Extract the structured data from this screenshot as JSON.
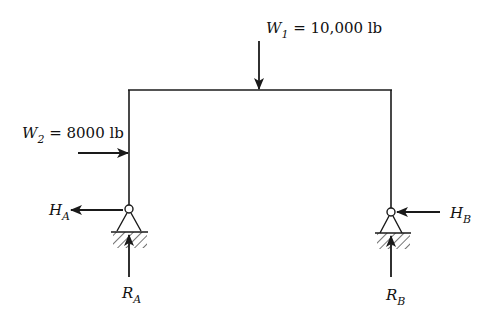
{
  "diagram": {
    "type": "portal frame with pinned supports",
    "colors": {
      "line": "#1a1a1a",
      "background": "#ffffff",
      "hatch": "#333333"
    },
    "loads": {
      "w1": {
        "symbol": "W",
        "subscript": "1",
        "value_text": " = 10,000 lb",
        "magnitude": 10000,
        "unit": "lb",
        "direction": "down",
        "applied_at": "top beam"
      },
      "w2": {
        "symbol": "W",
        "subscript": "2",
        "value_text": " = 8000 lb",
        "magnitude": 8000,
        "unit": "lb",
        "direction": "right",
        "applied_at": "left column"
      }
    },
    "reactions": {
      "ha": {
        "symbol": "H",
        "subscript": "A",
        "direction": "left"
      },
      "hb": {
        "symbol": "H",
        "subscript": "B",
        "direction": "left"
      },
      "ra": {
        "symbol": "R",
        "subscript": "A",
        "direction": "up"
      },
      "rb": {
        "symbol": "R",
        "subscript": "B",
        "direction": "up"
      }
    },
    "supports": [
      {
        "name": "A",
        "kind": "pin"
      },
      {
        "name": "B",
        "kind": "pin"
      }
    ]
  }
}
